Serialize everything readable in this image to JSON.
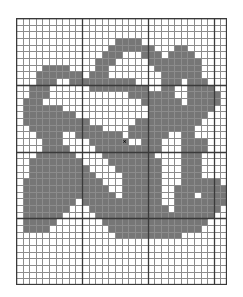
{
  "document": {
    "kind": "cross-stitch-chart",
    "title": "Cross Stitch Pattern Chart"
  },
  "chart_data": {
    "type": "heatmap",
    "xlabel": "",
    "ylabel": "",
    "grid": true,
    "columns": 32,
    "rows": 40,
    "cell_size_px": 6.6,
    "bold_line_every": 10,
    "colors": {
      "background": "#ffffff",
      "filled": "#767676",
      "grid_line": "#8c8c8c",
      "grid_line_bold": "#3a3a3a",
      "marker": "#000000",
      "page_background": "#ffffff"
    },
    "legend": [
      {
        "symbol": "filled",
        "label": "Stitch",
        "color": "#767676"
      },
      {
        "symbol": "x",
        "label": "Center",
        "color": "#000000"
      }
    ],
    "center_marker": {
      "symbol": "×",
      "col": 16,
      "row": 18
    },
    "filled_rows": [
      {
        "row": 0,
        "cols": []
      },
      {
        "row": 1,
        "cols": []
      },
      {
        "row": 2,
        "cols": []
      },
      {
        "row": 3,
        "cols": [
          15,
          16,
          17,
          18
        ]
      },
      {
        "row": 4,
        "cols": [
          14,
          15,
          16,
          17,
          18,
          19,
          20,
          24,
          25
        ]
      },
      {
        "row": 5,
        "cols": [
          13,
          14,
          15,
          19,
          20,
          21,
          23,
          24,
          25,
          26
        ]
      },
      {
        "row": 6,
        "cols": [
          12,
          13,
          14,
          20,
          21,
          22,
          23,
          24,
          25,
          26,
          27
        ]
      },
      {
        "row": 7,
        "cols": [
          4,
          5,
          6,
          7,
          12,
          13,
          21,
          22,
          23,
          24,
          25,
          26,
          27
        ]
      },
      {
        "row": 8,
        "cols": [
          3,
          4,
          5,
          6,
          7,
          8,
          9,
          11,
          12,
          13,
          22,
          23,
          24,
          25,
          26,
          27
        ]
      },
      {
        "row": 9,
        "cols": [
          3,
          4,
          5,
          8,
          9,
          10,
          11,
          12,
          13,
          14,
          15,
          16,
          17,
          22,
          23,
          24,
          26,
          27,
          28
        ]
      },
      {
        "row": 10,
        "cols": [
          2,
          3,
          4,
          11,
          12,
          13,
          14,
          15,
          16,
          17,
          18,
          19,
          22,
          23,
          26,
          27,
          28,
          29
        ]
      },
      {
        "row": 11,
        "cols": [
          2,
          3,
          4,
          17,
          18,
          19,
          20,
          21,
          22,
          23,
          26,
          27,
          28,
          29,
          30
        ]
      },
      {
        "row": 12,
        "cols": [
          1,
          2,
          3,
          19,
          20,
          21,
          22,
          23,
          24,
          26,
          27,
          28,
          29,
          30
        ]
      },
      {
        "row": 13,
        "cols": [
          1,
          2,
          3,
          4,
          5,
          6,
          20,
          21,
          22,
          23,
          24,
          25,
          26,
          27,
          28,
          29
        ]
      },
      {
        "row": 14,
        "cols": [
          1,
          2,
          3,
          4,
          5,
          6,
          7,
          8,
          20,
          21,
          22,
          23,
          24,
          25,
          26,
          27,
          28
        ]
      },
      {
        "row": 15,
        "cols": [
          1,
          2,
          3,
          4,
          5,
          6,
          7,
          8,
          9,
          10,
          18,
          19,
          20,
          21,
          22,
          23,
          24,
          25,
          26,
          27
        ]
      },
      {
        "row": 16,
        "cols": [
          2,
          3,
          4,
          5,
          6,
          7,
          8,
          9,
          10,
          11,
          12,
          17,
          18,
          19,
          20,
          21,
          22,
          23,
          24,
          25,
          26
        ]
      },
      {
        "row": 17,
        "cols": [
          3,
          4,
          5,
          6,
          9,
          10,
          11,
          12,
          13,
          14,
          15,
          17,
          18,
          19,
          20,
          21,
          22,
          25,
          26
        ]
      },
      {
        "row": 18,
        "cols": [
          4,
          5,
          6,
          11,
          12,
          13,
          14,
          15,
          16,
          19,
          20,
          21,
          25,
          26,
          27,
          28
        ]
      },
      {
        "row": 19,
        "cols": [
          4,
          5,
          6,
          7,
          12,
          13,
          14,
          15,
          16,
          17,
          18,
          19,
          20,
          21,
          25,
          26,
          27,
          28
        ]
      },
      {
        "row": 20,
        "cols": [
          3,
          4,
          5,
          6,
          7,
          8,
          13,
          14,
          15,
          16,
          17,
          18,
          19,
          20,
          25,
          26,
          27
        ]
      },
      {
        "row": 21,
        "cols": [
          2,
          3,
          4,
          5,
          6,
          7,
          8,
          9,
          14,
          15,
          16,
          17,
          18,
          19,
          20,
          21,
          25,
          26,
          27
        ]
      },
      {
        "row": 22,
        "cols": [
          2,
          3,
          4,
          5,
          6,
          7,
          8,
          9,
          10,
          15,
          16,
          17,
          18,
          19,
          20,
          21,
          25,
          26,
          27
        ]
      },
      {
        "row": 23,
        "cols": [
          2,
          3,
          4,
          5,
          6,
          7,
          8,
          9,
          10,
          11,
          16,
          17,
          18,
          19,
          20,
          21,
          25,
          26,
          27
        ]
      },
      {
        "row": 24,
        "cols": [
          1,
          2,
          3,
          4,
          5,
          6,
          7,
          8,
          9,
          10,
          11,
          12,
          16,
          17,
          18,
          19,
          20,
          21,
          25,
          26,
          27,
          28,
          29,
          30
        ]
      },
      {
        "row": 25,
        "cols": [
          1,
          2,
          3,
          4,
          5,
          6,
          7,
          8,
          9,
          10,
          11,
          12,
          13,
          16,
          17,
          18,
          19,
          20,
          21,
          24,
          25,
          26,
          27,
          28,
          29,
          30,
          31
        ]
      },
      {
        "row": 26,
        "cols": [
          1,
          2,
          3,
          4,
          5,
          6,
          7,
          8,
          9,
          10,
          11,
          12,
          13,
          14,
          16,
          17,
          18,
          19,
          20,
          21,
          24,
          25,
          26,
          28,
          29,
          30,
          31
        ]
      },
      {
        "row": 27,
        "cols": [
          1,
          2,
          3,
          4,
          5,
          6,
          7,
          8,
          10,
          11,
          12,
          13,
          14,
          15,
          16,
          17,
          18,
          19,
          20,
          21,
          24,
          25,
          26,
          27,
          28,
          29,
          30,
          31
        ]
      },
      {
        "row": 28,
        "cols": [
          1,
          2,
          3,
          4,
          5,
          6,
          7,
          11,
          12,
          13,
          14,
          15,
          16,
          17,
          18,
          19,
          20,
          21,
          22,
          24,
          25,
          26,
          27,
          28,
          29,
          30
        ]
      },
      {
        "row": 29,
        "cols": [
          1,
          2,
          3,
          4,
          5,
          6,
          12,
          13,
          14,
          15,
          16,
          17,
          18,
          19,
          20,
          21,
          22,
          23,
          24,
          25,
          26,
          27,
          28,
          29
        ]
      },
      {
        "row": 30,
        "cols": [
          1,
          2,
          3,
          4,
          5,
          13,
          14,
          15,
          16,
          17,
          18,
          19,
          20,
          21,
          22,
          23,
          24,
          25,
          26,
          27,
          28
        ]
      },
      {
        "row": 31,
        "cols": [
          1,
          2,
          3,
          4,
          14,
          15,
          16,
          17,
          18,
          19,
          20,
          21,
          22,
          23,
          24,
          25,
          26,
          27
        ]
      },
      {
        "row": 32,
        "cols": [
          15,
          16,
          17,
          18,
          19,
          20,
          21,
          22,
          23,
          24
        ]
      },
      {
        "row": 33,
        "cols": []
      },
      {
        "row": 34,
        "cols": []
      },
      {
        "row": 35,
        "cols": []
      },
      {
        "row": 36,
        "cols": []
      },
      {
        "row": 37,
        "cols": []
      },
      {
        "row": 38,
        "cols": []
      },
      {
        "row": 39,
        "cols": []
      }
    ]
  }
}
